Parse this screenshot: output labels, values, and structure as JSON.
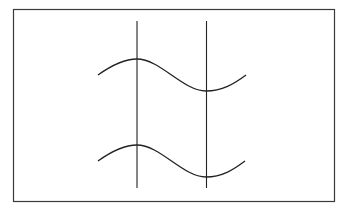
{
  "diagram": {
    "frame": {
      "x": 13,
      "y": 9,
      "width": 322,
      "height": 192,
      "stroke": "#333333"
    },
    "vertical_lines": [
      {
        "x": 137,
        "y1": 21,
        "y2": 188
      },
      {
        "x": 206,
        "y1": 21,
        "y2": 188
      }
    ],
    "curves": [
      {
        "name": "upper-wave",
        "start": [
          98,
          75
        ],
        "peak": [
          137,
          59
        ],
        "trough": [
          206,
          91
        ],
        "end": [
          246,
          75
        ]
      },
      {
        "name": "lower-wave",
        "start": [
          98,
          161
        ],
        "peak": [
          137,
          145
        ],
        "trough": [
          206,
          177
        ],
        "end": [
          245,
          161
        ]
      }
    ],
    "line_color": "#222222"
  }
}
